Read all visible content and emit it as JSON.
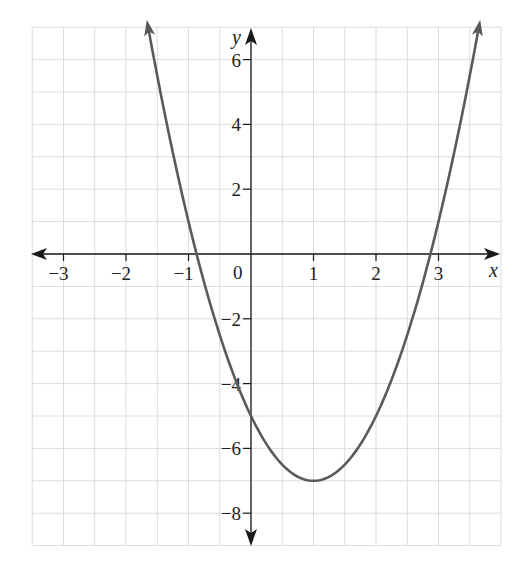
{
  "chart_data": {
    "type": "line",
    "title": "",
    "xlabel": "x",
    "ylabel": "y",
    "origin_label": "0",
    "xlim": [
      -3.5,
      4
    ],
    "ylim": [
      -9,
      7
    ],
    "grid": true,
    "grid_step_x": 0.5,
    "grid_step_y": 1,
    "x_ticks": [
      -3,
      -2,
      -1,
      1,
      2,
      3
    ],
    "x_tick_labels": [
      "−3",
      "−2",
      "−1",
      "1",
      "2",
      "3"
    ],
    "y_ticks": [
      6,
      4,
      2,
      -2,
      -4,
      -6,
      -8
    ],
    "y_tick_labels": [
      "6",
      "4",
      "2",
      "−2",
      "−4",
      "−6",
      "−8"
    ],
    "legend": null,
    "series": [
      {
        "name": "parabola",
        "equation": "y = 2(x - 1)^2 - 7",
        "vertex": [
          1,
          -7
        ],
        "y_intercept": -5,
        "x_intercepts": [
          -0.87,
          2.87
        ],
        "x_range": [
          -1.65,
          3.65
        ],
        "arrows_at_ends": true,
        "color": "#5a5a5a",
        "points": [
          {
            "x": -1.65,
            "y": 7.0
          },
          {
            "x": -1.5,
            "y": 5.5
          },
          {
            "x": -1,
            "y": 1
          },
          {
            "x": -0.87,
            "y": 0
          },
          {
            "x": -0.5,
            "y": -2.5
          },
          {
            "x": 0,
            "y": -5
          },
          {
            "x": 0.5,
            "y": -6.5
          },
          {
            "x": 1,
            "y": -7
          },
          {
            "x": 1.5,
            "y": -6.5
          },
          {
            "x": 2,
            "y": -5
          },
          {
            "x": 2.5,
            "y": -2.5
          },
          {
            "x": 2.87,
            "y": 0
          },
          {
            "x": 3,
            "y": 1
          },
          {
            "x": 3.5,
            "y": 5.5
          },
          {
            "x": 3.65,
            "y": 7.0
          }
        ]
      }
    ]
  },
  "colors": {
    "grid": "#dcdcdc",
    "axis": "#1a1a1a",
    "curve": "#5a5a5a",
    "background": "#ffffff"
  }
}
